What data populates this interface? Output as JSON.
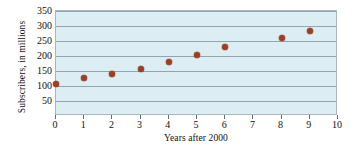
{
  "chart_data": {
    "type": "scatter",
    "title": "",
    "xlabel": "Years after 2000",
    "ylabel": "Subscribers, in millions",
    "xlim": [
      0,
      10
    ],
    "ylim": [
      0,
      350
    ],
    "grid": true,
    "legend": "none",
    "marker_color": "#9d3f21",
    "plot_background": "#dceef3",
    "gridline_color": "#8fa6ae",
    "x_ticks": [
      0,
      1,
      2,
      3,
      4,
      5,
      6,
      7,
      8,
      9,
      10
    ],
    "x_tick_labels": [
      "0",
      "1",
      "2",
      "3",
      "4",
      "5",
      "6",
      "7",
      "8",
      "9",
      "10"
    ],
    "y_ticks": [
      50,
      100,
      150,
      200,
      250,
      300,
      350
    ],
    "y_tick_labels": [
      "50",
      "100",
      "150",
      "200",
      "250",
      "300",
      "350"
    ],
    "points": [
      {
        "x": 0,
        "y": 108
      },
      {
        "x": 1,
        "y": 127
      },
      {
        "x": 2,
        "y": 140
      },
      {
        "x": 3,
        "y": 157
      },
      {
        "x": 4,
        "y": 180
      },
      {
        "x": 5,
        "y": 205
      },
      {
        "x": 6,
        "y": 230
      },
      {
        "x": 8,
        "y": 261
      },
      {
        "x": 9,
        "y": 283
      }
    ],
    "x": [
      0,
      1,
      2,
      3,
      4,
      5,
      6,
      8,
      9
    ],
    "values": [
      108,
      127,
      140,
      157,
      180,
      205,
      230,
      261,
      283
    ]
  }
}
